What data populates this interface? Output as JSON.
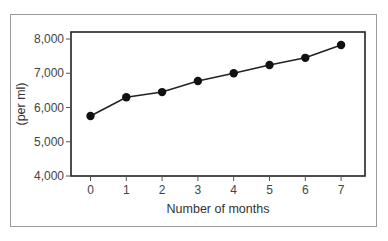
{
  "chart_data": {
    "type": "line",
    "title": "",
    "xlabel": "Number of months",
    "ylabel": "(per ml)",
    "x": [
      0,
      1,
      2,
      3,
      4,
      5,
      6,
      7
    ],
    "series": [
      {
        "name": "count",
        "values": [
          5750,
          6300,
          6450,
          6775,
          7000,
          7240,
          7450,
          7825
        ]
      }
    ],
    "xticks": [
      "0",
      "1",
      "2",
      "3",
      "4",
      "5",
      "6",
      "7"
    ],
    "yticks": [
      4000,
      5000,
      6000,
      7000,
      8000
    ],
    "ytick_labels": [
      "4,000",
      "5,000",
      "6,000",
      "7,000",
      "8,000"
    ],
    "ylim": [
      4000,
      8000
    ],
    "xlim": [
      -0.55,
      7.65
    ],
    "grid": false,
    "legend": "none",
    "colors": {
      "line": "#222222",
      "marker": "#111111",
      "axis": "#222222",
      "frame": "#9a9a9a"
    }
  }
}
